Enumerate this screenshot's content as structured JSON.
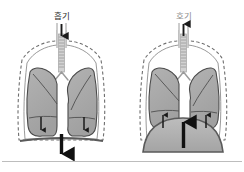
{
  "figure": {
    "width": 244,
    "height": 172,
    "background_color": "#ffffff",
    "bottom_rule_color": "#b9b9b9"
  },
  "palette": {
    "lung_fill": "#a8a8a8",
    "lung_stroke": "#4a4a4a",
    "lung_lobe_line": "#4f4f4f",
    "thorax_fill": "#ffffff",
    "thorax_stroke": "#8d8d8d",
    "dashed_outline": "#6e6e6e",
    "diaphragm_stroke": "#5a5a5a",
    "diaphragm_fill": "#b0b0b0",
    "trachea_fill": "#d0d0d0",
    "trachea_ring": "#9a9a9a",
    "arrow_color": "#1a1a1a",
    "label_color": "#2b2b2b"
  },
  "panels": [
    {
      "id": "inhalation",
      "label": "흡기",
      "label_meaning": "inhalation",
      "label_faint": false,
      "airflow_direction": "down",
      "lung_arrows_direction": "down",
      "body_arrow_direction": "down",
      "diaphragm_shape": "flat",
      "diaphragm_shaded": false,
      "lung_arrow_count": 2
    },
    {
      "id": "exhalation",
      "label": "호기",
      "label_meaning": "exhalation",
      "label_faint": true,
      "airflow_direction": "up",
      "lung_arrows_direction": "up",
      "body_arrow_direction": "up",
      "diaphragm_shape": "domed",
      "diaphragm_shaded": true,
      "lung_arrow_count": 2
    }
  ],
  "icons": {
    "trachea_arrow_down": "arrow-down-icon",
    "trachea_arrow_up": "arrow-up-icon",
    "lung_arrow_down": "arrow-down-small-icon",
    "lung_arrow_up": "arrow-up-small-icon",
    "body_arrow_down": "arrow-down-large-icon",
    "body_arrow_up": "arrow-up-large-icon"
  }
}
